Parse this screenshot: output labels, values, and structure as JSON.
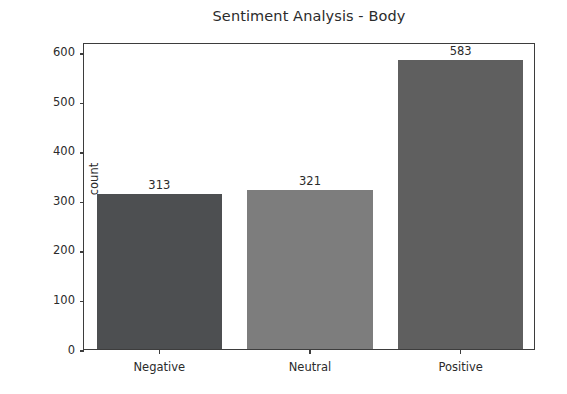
{
  "chart_data": {
    "type": "bar",
    "title": "Sentiment Analysis - Body",
    "xlabel": "",
    "ylabel": "count",
    "categories": [
      "Negative",
      "Neutral",
      "Positive"
    ],
    "values": [
      313,
      321,
      583
    ],
    "data_labels": [
      "313",
      "321",
      "583"
    ],
    "bar_colors": [
      "#4d4f51",
      "#7d7d7d",
      "#5f5f5f"
    ],
    "ylim": [
      0,
      620
    ],
    "yticks": [
      0,
      100,
      200,
      300,
      400,
      500,
      600
    ],
    "ytick_labels": [
      "0",
      "100",
      "200",
      "300",
      "400",
      "500",
      "600"
    ],
    "grid": false,
    "legend": null,
    "background": "#ffffff",
    "axis_color": "#3d3d3d"
  }
}
